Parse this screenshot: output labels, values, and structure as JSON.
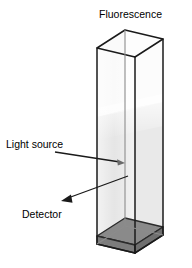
{
  "figure": {
    "type": "fluorescence-spectroscopy-cuvette-diagram",
    "title": "Fluorescence",
    "labels": {
      "light_source": "Light source",
      "detector": "Detector"
    },
    "colors": {
      "outline": "#1a1a1a",
      "inner_edge": "#8c8c8c",
      "liquid": "#e2e2e2",
      "liquid_top": "#f0f0f0",
      "base": "#8a8a8a",
      "base_edge": "#2b2b2b",
      "glass": "#fbfbfb",
      "background": "#ffffff",
      "arrow": "#1a1a1a"
    },
    "geometry": {
      "front_face": {
        "top_left": [
          97,
          48
        ],
        "top_right": [
          135,
          57
        ],
        "bottom_right": [
          135,
          253
        ],
        "bottom_left": [
          97,
          244
        ]
      },
      "back_face": {
        "top_left": [
          125,
          30
        ],
        "top_right": [
          163,
          39
        ],
        "bottom_right": [
          163,
          235
        ],
        "bottom_left": [
          125,
          226
        ]
      },
      "liquid_level_front_left_y": 112,
      "liquid_level_front_right_y": 105,
      "base_top_front_left": [
        97,
        236
      ],
      "base_height_px": 12
    },
    "annotations": [
      {
        "name": "light-source-arrow",
        "label": "Light source",
        "text_anchor": [
          6,
          145
        ],
        "line_from": [
          55,
          152
        ],
        "line_to": [
          123,
          163
        ],
        "arrow_direction": "right"
      },
      {
        "name": "detector-arrow",
        "label": "Detector",
        "text_anchor": [
          22,
          214
        ],
        "line_from": [
          128,
          176
        ],
        "line_to": [
          62,
          200
        ],
        "arrow_direction": "down-left"
      },
      {
        "name": "fluorescence-title",
        "label": "Fluorescence",
        "text_anchor": [
          99,
          18
        ]
      }
    ]
  }
}
